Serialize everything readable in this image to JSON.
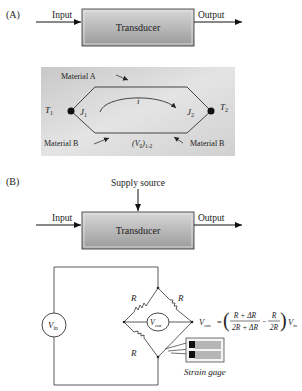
{
  "panel_a": {
    "label": "(A)",
    "input_label": "Input",
    "output_label": "Output",
    "block_label": "Transducer",
    "thermocouple": {
      "material_a": "Material A",
      "material_b_left": "Material B",
      "material_b_right": "Material B",
      "t1": "T",
      "t1_sub": "1",
      "t2": "T",
      "t2_sub": "2",
      "j1": "J",
      "j1_sub": "1",
      "j2": "J",
      "j2_sub": "2",
      "current": "i",
      "voltage": "(V",
      "voltage_sub_0": "0",
      "voltage_close": ")",
      "voltage_sub_12": "1-2"
    }
  },
  "panel_b": {
    "label": "(B)",
    "supply_label": "Supply source",
    "input_label": "Input",
    "output_label": "Output",
    "block_label": "Transducer",
    "bridge": {
      "vin": "V",
      "vin_sub": "in",
      "vout": "V",
      "vout_sub": "out",
      "r_top_left": "R",
      "r_top_right": "R",
      "r_bottom_left": "R",
      "formula_lhs": "V",
      "formula_lhs_sub": "out",
      "formula_eq": "=",
      "frac1_num": "R + ΔR",
      "frac1_den": "2R + ΔR",
      "minus": "−",
      "frac2_num": "R",
      "frac2_den": "2R",
      "formula_rhs": "V",
      "formula_rhs_sub": "in",
      "strain_gage_label": "Strain gage"
    }
  }
}
